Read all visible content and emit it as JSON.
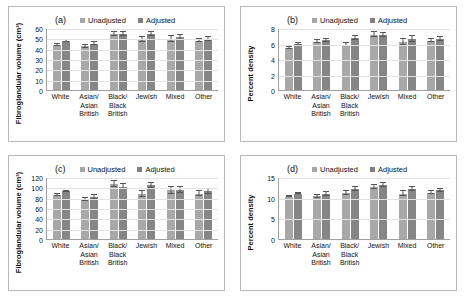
{
  "figure": {
    "legend": {
      "unadjusted": "Unadjusted",
      "adjusted": "Adjusted"
    },
    "categories": [
      "White",
      "Asian/ Asian British",
      "Black/ Black British",
      "Jewish",
      "Mixed",
      "Other"
    ],
    "category_lines": [
      [
        "White"
      ],
      [
        "Asian/",
        "Asian",
        "British"
      ],
      [
        "Black/",
        "Black",
        "British"
      ],
      [
        "Jewish"
      ],
      [
        "Mixed"
      ],
      [
        "Other"
      ]
    ],
    "colors": {
      "unadjusted": "#a8a8a8",
      "adjusted": "#868686",
      "grid": "#e2e2e2",
      "axis": "#a0a0a0",
      "border": "#b9b9b9"
    }
  },
  "panels": [
    {
      "letter": "(a)",
      "ylabel": "Fibroglandular volume (cm³)"
    },
    {
      "letter": "(b)",
      "ylabel": "Percent density"
    },
    {
      "letter": "(c)",
      "ylabel": "Fibroglandular volume (cm³)"
    },
    {
      "letter": "(d)",
      "ylabel": "Percent density"
    }
  ],
  "chart_data": [
    {
      "type": "bar",
      "panel": "(a)",
      "title": "",
      "xlabel": "",
      "ylabel": "Fibroglandular volume (cm³)",
      "ylim": [
        0,
        60
      ],
      "yticks": [
        0,
        10,
        20,
        30,
        40,
        50,
        60
      ],
      "grid": true,
      "legend_position": "top",
      "categories": [
        "White",
        "Asian/ Asian British",
        "Black/ Black British",
        "Jewish",
        "Mixed",
        "Other"
      ],
      "series": [
        {
          "name": "Unadjusted",
          "values": [
            43.5,
            42.2,
            54.5,
            49.0,
            49.5,
            47.8
          ],
          "errors": [
            0.6,
            1.1,
            2.0,
            2.2,
            3.0,
            1.8
          ]
        },
        {
          "name": "Adjusted",
          "values": [
            47.3,
            44.8,
            54.5,
            54.5,
            51.0,
            49.5
          ],
          "errors": [
            0.7,
            1.4,
            2.0,
            2.0,
            2.3,
            1.6
          ]
        }
      ]
    },
    {
      "type": "bar",
      "panel": "(b)",
      "title": "",
      "xlabel": "",
      "ylabel": "Percent density",
      "ylim": [
        0,
        8
      ],
      "yticks": [
        0,
        2,
        4,
        6,
        8
      ],
      "grid": true,
      "legend_position": "top",
      "categories": [
        "White",
        "Asian/ Asian British",
        "Black/ Black British",
        "Jewish",
        "Mixed",
        "Other"
      ],
      "series": [
        {
          "name": "Unadjusted",
          "values": [
            5.45,
            6.25,
            5.85,
            7.15,
            6.2,
            6.35
          ],
          "errors": [
            0.1,
            0.2,
            0.2,
            0.3,
            0.35,
            0.2
          ]
        },
        {
          "name": "Adjusted",
          "values": [
            5.95,
            6.4,
            6.7,
            7.1,
            6.6,
            6.55
          ],
          "errors": [
            0.1,
            0.2,
            0.25,
            0.3,
            0.35,
            0.25
          ]
        }
      ]
    },
    {
      "type": "bar",
      "panel": "(c)",
      "title": "",
      "xlabel": "",
      "ylabel": "Fibroglandular volume (cm³)",
      "ylim": [
        0,
        120
      ],
      "yticks": [
        0,
        20,
        40,
        60,
        80,
        100,
        120
      ],
      "grid": true,
      "legend_position": "top",
      "categories": [
        "White",
        "Asian/ Asian British",
        "Black/ Black British",
        "Jewish",
        "Mixed",
        "Other"
      ],
      "series": [
        {
          "name": "Unadjusted",
          "values": [
            85.5,
            76.0,
            107.0,
            87.0,
            94.0,
            88.0
          ],
          "errors": [
            1.5,
            3.0,
            6.0,
            5.0,
            7.0,
            4.0
          ]
        },
        {
          "name": "Adjusted",
          "values": [
            92.0,
            81.0,
            101.5,
            104.0,
            94.5,
            92.0
          ],
          "errors": [
            1.5,
            3.5,
            5.5,
            5.0,
            6.0,
            4.0
          ]
        }
      ]
    },
    {
      "type": "bar",
      "panel": "(d)",
      "title": "",
      "xlabel": "",
      "ylabel": "Percent density",
      "ylim": [
        0,
        15
      ],
      "yticks": [
        0,
        5,
        10,
        15
      ],
      "grid": true,
      "legend_position": "top",
      "categories": [
        "White",
        "Asian/ Asian British",
        "Black/ Black British",
        "Jewish",
        "Mixed",
        "Other"
      ],
      "series": [
        {
          "name": "Unadjusted",
          "values": [
            10.2,
            10.3,
            11.1,
            12.5,
            11.0,
            11.2
          ],
          "errors": [
            0.15,
            0.4,
            0.4,
            0.5,
            0.6,
            0.4
          ]
        },
        {
          "name": "Adjusted",
          "values": [
            11.0,
            10.9,
            12.1,
            13.0,
            12.0,
            11.8
          ],
          "errors": [
            0.2,
            0.4,
            0.4,
            0.5,
            0.5,
            0.4
          ]
        }
      ]
    }
  ]
}
